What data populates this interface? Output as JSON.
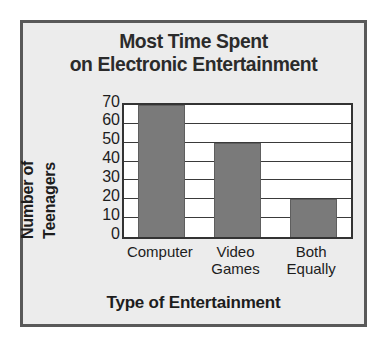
{
  "chart_data": {
    "type": "bar",
    "title": "Most Time Spent\non Electronic Entertainment",
    "title_lines": [
      "Most Time Spent",
      "on Electronic Entertainment"
    ],
    "categories": [
      "Computer",
      "Video Games",
      "Both Equally"
    ],
    "category_lines": [
      [
        "Computer"
      ],
      [
        "Video",
        "Games"
      ],
      [
        "Both",
        "Equally"
      ]
    ],
    "values": [
      70,
      50,
      20
    ],
    "xlabel": "Type of Entertainment",
    "ylabel": "Number of Teenagers",
    "ylabel_lines": [
      "Number of",
      "Teenagers"
    ],
    "ylim": [
      0,
      70
    ],
    "ytick_labels": [
      "70",
      "60",
      "50",
      "40",
      "30",
      "20",
      "10",
      "0"
    ],
    "ytick_values": [
      70,
      60,
      50,
      40,
      30,
      20,
      10,
      0
    ],
    "ytick_step": 10,
    "grid": true,
    "grid_axis": "y",
    "legend": false,
    "bar_color": "#7a7a7a",
    "plot_background": "#ffffff",
    "figure_background": "#ececec",
    "border_color": "#595959",
    "text_color": "#1d1d1d"
  }
}
